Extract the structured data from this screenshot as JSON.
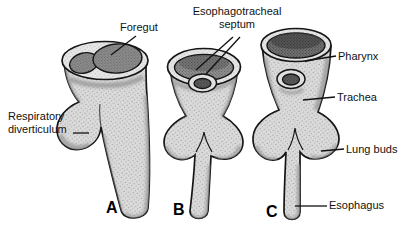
{
  "figure": {
    "labels": {
      "foregut": "Foregut",
      "esophagotracheal_septum": "Esophagotracheal septum",
      "respiratory_diverticulum": "Respiratory diverticulum",
      "pharynx": "Pharynx",
      "trachea": "Trachea",
      "lung_buds": "Lung buds",
      "esophagus": "Esophagus"
    },
    "stage_letters": {
      "a": "A",
      "b": "B",
      "c": "C"
    },
    "colors": {
      "background": "#ffffff",
      "outline": "#151515",
      "body_fill": "#dadada",
      "rim_fill": "#e6e6e6",
      "lumen_fill": "#8f8f8f",
      "dark_lumen_fill": "#6f6f6f",
      "leader_line": "#111111"
    }
  }
}
